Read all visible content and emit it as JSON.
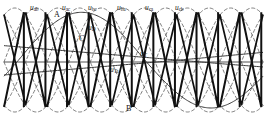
{
  "figure": {
    "background": "#ffffff",
    "width": 267,
    "height": 118
  },
  "colors": {
    "sine_dashed": "#6f6f6f",
    "sawtooth_bold": "#111111",
    "control_curve": "#3a3a3a",
    "axis": "#555555",
    "text": "#1a1a1a"
  },
  "axis": {
    "baseline_y": 62,
    "x_start": 4,
    "x_end": 263,
    "show_axis_line": true,
    "show_grid": false
  },
  "line_voltage_labels": [
    {
      "name": "u-ab",
      "base": "u",
      "sub": "ab",
      "x": 30,
      "y": 4
    },
    {
      "name": "u-ac",
      "base": "u",
      "sub": "ac",
      "x": 62,
      "y": 4
    },
    {
      "name": "u-bc",
      "base": "u",
      "sub": "bc",
      "x": 88,
      "y": 4
    },
    {
      "name": "u-ba",
      "base": "u",
      "sub": "ba",
      "x": 117,
      "y": 4
    },
    {
      "name": "u-ca",
      "base": "u",
      "sub": "ca",
      "x": 145,
      "y": 4
    },
    {
      "name": "u-cb",
      "base": "u",
      "sub": "cb",
      "x": 175,
      "y": 4
    }
  ],
  "curve_labels": [
    {
      "name": "u-D",
      "base": "u",
      "sub": "D",
      "x": 88,
      "y": 24
    },
    {
      "name": "u-T",
      "base": "u",
      "sub": "T",
      "x": 140,
      "y": 50
    },
    {
      "name": "u-Ta",
      "base": "u",
      "sub": "Ta",
      "x": 110,
      "y": 66
    }
  ],
  "point_labels": [
    {
      "name": "point-A",
      "text": "A",
      "x": 54,
      "y": 11
    },
    {
      "name": "point-C",
      "text": "C",
      "x": 79,
      "y": 35
    },
    {
      "name": "point-B",
      "text": "B",
      "x": 126,
      "y": 105
    }
  ],
  "chart_data": {
    "type": "line",
    "xlabel": "",
    "ylabel": "",
    "xlim": [
      0,
      360
    ],
    "ylim": [
      -1.15,
      1.15
    ],
    "grid": false,
    "legend": "none",
    "series": [
      {
        "name": "u_ab",
        "style": "dashed",
        "phase_deg": 0,
        "amplitude": 1.0
      },
      {
        "name": "u_ac",
        "style": "dashed",
        "phase_deg": 60,
        "amplitude": 1.0
      },
      {
        "name": "u_bc",
        "style": "dashed",
        "phase_deg": 120,
        "amplitude": 1.0
      },
      {
        "name": "u_ba",
        "style": "dashed",
        "phase_deg": 180,
        "amplitude": 1.0
      },
      {
        "name": "u_ca",
        "style": "dashed",
        "phase_deg": 240,
        "amplitude": 1.0
      },
      {
        "name": "u_cb",
        "style": "dashed",
        "phase_deg": 300,
        "amplitude": 1.0
      },
      {
        "name": "u_T",
        "style": "solid-thin",
        "description": "slow rising control reference",
        "amplitude": 0.42
      },
      {
        "name": "u_Ta",
        "style": "solid-thin",
        "description": "synchronizing cosine reference",
        "amplitude": 0.92
      },
      {
        "name": "u_D",
        "style": "solid-bold",
        "description": "sawtooth firing ramps, 12 per cycle",
        "count": 12,
        "amplitude": 0.95
      }
    ],
    "cycles": 2,
    "sawtooth_count": 12
  }
}
